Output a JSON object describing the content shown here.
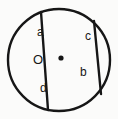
{
  "figure": {
    "name": "circle-with-two-intersecting-chords",
    "background_color": "#fbfbfa",
    "stroke_color": "#161616",
    "text_color": "#161616",
    "circle": {
      "center_x": 59,
      "center_y": 60,
      "radius": 51,
      "stroke_width": 2.4
    },
    "center_point": {
      "label": "O",
      "dot_x": 61,
      "dot_y": 58,
      "dot_radius": 2.6
    },
    "chords": [
      {
        "name": "chord-upper-left-to-lower-left",
        "x1": 41,
        "y1": 12,
        "x2": 48,
        "y2": 110,
        "stroke_width": 2.4
      },
      {
        "name": "chord-upper-right-to-lower-right",
        "x1": 94,
        "y1": 21,
        "x2": 101,
        "y2": 94,
        "stroke_width": 2.4
      }
    ],
    "region_labels": [
      {
        "id": "a",
        "text": "a"
      },
      {
        "id": "b",
        "text": "b"
      },
      {
        "id": "c",
        "text": "c"
      },
      {
        "id": "d",
        "text": "d"
      }
    ]
  }
}
